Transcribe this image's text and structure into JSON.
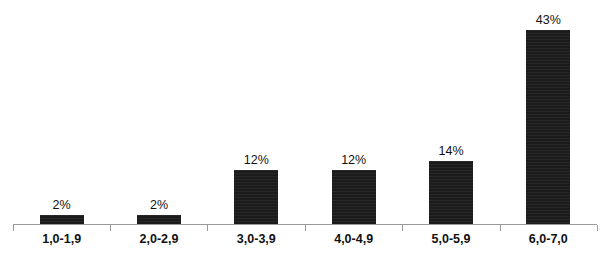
{
  "chart_data": {
    "type": "bar",
    "title": "",
    "subtitle": "",
    "xlabel": "",
    "ylabel": "",
    "categories": [
      "1,0-1,9",
      "2,0-2,9",
      "3,0-3,9",
      "4,0-4,9",
      "5,0-5,9",
      "6,0-7,0"
    ],
    "values": [
      2,
      12,
      12,
      14,
      43,
      2
    ],
    "series": [
      {
        "name": "",
        "values": [
          2,
          2,
          12,
          12,
          14,
          43
        ]
      }
    ],
    "data_labels": [
      "2%",
      "2%",
      "12%",
      "12%",
      "14%",
      "43%"
    ],
    "ylim": [
      0,
      43
    ],
    "grid": false,
    "legend": false,
    "legend_position": "none",
    "value_suffix": "%",
    "bar_color": "#1b1b1b",
    "axis_color": "#9a9a9a",
    "background_color": "#ffffff",
    "text_color": "#111111"
  },
  "bars": [
    {
      "category": "1,0-1,9",
      "value": 2,
      "label": "2%"
    },
    {
      "category": "2,0-2,9",
      "value": 2,
      "label": "2%"
    },
    {
      "category": "3,0-3,9",
      "value": 12,
      "label": "12%"
    },
    {
      "category": "4,0-4,9",
      "value": 12,
      "label": "12%"
    },
    {
      "category": "5,0-5,9",
      "value": 14,
      "label": "14%"
    },
    {
      "category": "6,0-7,0",
      "value": 43,
      "label": "43%"
    }
  ]
}
